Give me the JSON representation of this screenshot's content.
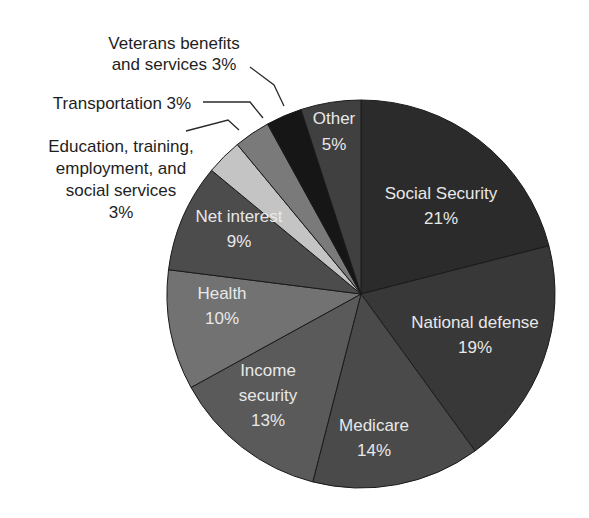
{
  "chart_data": {
    "type": "pie",
    "title": "",
    "start_angle_deg": 0,
    "direction": "clockwise",
    "slices": [
      {
        "label": "Social Security",
        "value": 21,
        "pct_label": "21%",
        "color": "#2b2b2b",
        "label_pos": "inside"
      },
      {
        "label": "National defense",
        "value": 19,
        "pct_label": "19%",
        "color": "#383838",
        "label_pos": "inside"
      },
      {
        "label": "Medicare",
        "value": 14,
        "pct_label": "14%",
        "color": "#4a4a4a",
        "label_pos": "inside"
      },
      {
        "label": "Income security",
        "value": 13,
        "pct_label": "13%",
        "color": "#5a5a5a",
        "label_pos": "inside"
      },
      {
        "label": "Health",
        "value": 10,
        "pct_label": "10%",
        "color": "#727272",
        "label_pos": "inside"
      },
      {
        "label": "Net interest",
        "value": 9,
        "pct_label": "9%",
        "color": "#4c4c4c",
        "label_pos": "inside"
      },
      {
        "label": "Education, training, employment, and social services",
        "value": 3,
        "pct_label": "3%",
        "color": "#c4c4c4",
        "label_pos": "outside"
      },
      {
        "label": "Transportation",
        "value": 3,
        "pct_label": "3%",
        "color": "#7a7a7a",
        "label_pos": "outside"
      },
      {
        "label": "Veterans benefits and services",
        "value": 3,
        "pct_label": "3%",
        "color": "#161616",
        "label_pos": "outside"
      },
      {
        "label": "Other",
        "value": 5,
        "pct_label": "5%",
        "color": "#404040",
        "label_pos": "inside"
      }
    ],
    "labels": {
      "social_security": {
        "line1": "Social Security",
        "line2": "21%"
      },
      "national_defense": {
        "line1": "National defense",
        "line2": "19%"
      },
      "medicare": {
        "line1": "Medicare",
        "line2": "14%"
      },
      "income_security": {
        "line1": "Income",
        "line2": "security",
        "line3": "13%"
      },
      "health": {
        "line1": "Health",
        "line2": "10%"
      },
      "net_interest": {
        "line1": "Net interest",
        "line2": "9%"
      },
      "other": {
        "line1": "Other",
        "line2": "5%"
      },
      "education": {
        "line1": "Education, training,",
        "line2": "employment, and",
        "line3": "social services",
        "line4": "3%"
      },
      "transportation": {
        "line1": "Transportation 3%"
      },
      "veterans": {
        "line1": "Veterans benefits",
        "line2": "and services 3%"
      }
    },
    "legend": "none",
    "grid": false
  }
}
